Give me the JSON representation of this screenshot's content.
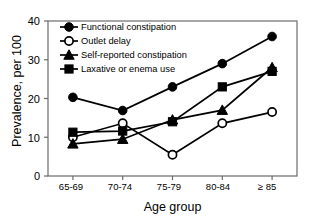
{
  "chart_data": {
    "type": "line",
    "title": "",
    "xlabel": "Age group",
    "ylabel": "Prevalence, per 100",
    "categories": [
      "65-69",
      "70-74",
      "75-79",
      "80-84",
      "≥ 85"
    ],
    "ylim": [
      0,
      40
    ],
    "yticks": [
      0,
      10,
      20,
      30,
      40
    ],
    "ytick_labels": [
      "0",
      "10",
      "20",
      "30",
      "40"
    ],
    "grid": false,
    "legend_position": "top-left",
    "series": [
      {
        "name": "Functional constipation",
        "marker": "filled-circle",
        "color": "#000000",
        "values": [
          20.3,
          16.9,
          23.0,
          29.0,
          36.0
        ]
      },
      {
        "name": "Outlet delay",
        "marker": "open-circle",
        "color": "#000000",
        "values": [
          10.0,
          13.6,
          5.5,
          13.6,
          16.5
        ]
      },
      {
        "name": "Self-reported constipation",
        "marker": "filled-triangle",
        "color": "#000000",
        "values": [
          8.3,
          9.5,
          14.5,
          17.0,
          28.0
        ]
      },
      {
        "name": "Laxative or enema use",
        "marker": "filled-square",
        "color": "#000000",
        "values": [
          11.3,
          11.6,
          14.0,
          23.0,
          27.0
        ]
      }
    ]
  },
  "figure": {
    "frame_color": "#6b6b6b",
    "ink_color": "#000000",
    "background": "#ffffff"
  }
}
